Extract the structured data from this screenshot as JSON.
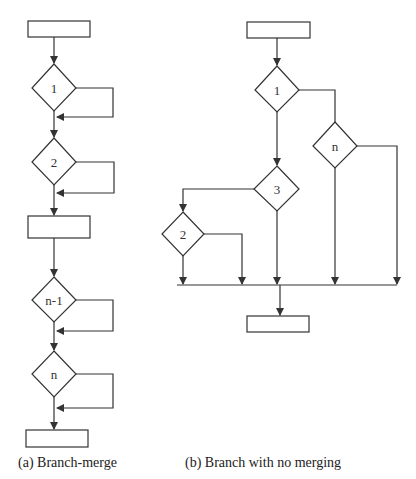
{
  "diagram_a": {
    "caption": "(a)  Branch-merge",
    "decisions": [
      "1",
      "2",
      "n-1",
      "n"
    ]
  },
  "diagram_b": {
    "caption": "(b)  Branch with no merging",
    "decisions": [
      "1",
      "n",
      "3",
      "2"
    ]
  },
  "colors": {
    "stroke": "#333333",
    "background": "#ffffff"
  }
}
